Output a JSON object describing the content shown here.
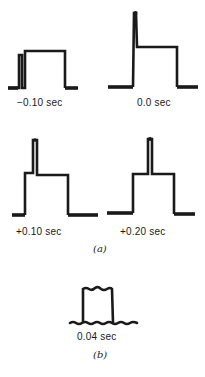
{
  "figure": {
    "panel_a": {
      "label": "(a)",
      "traces": [
        {
          "time_label": "−0.10 sec",
          "shape": "double-pulse"
        },
        {
          "time_label": "0.0 sec",
          "shape": "spike-then-plateau"
        },
        {
          "time_label": "+0.10 sec",
          "shape": "step-spike-plateau"
        },
        {
          "time_label": "+0.20 sec",
          "shape": "plateau-spike-plateau"
        }
      ]
    },
    "panel_b": {
      "label": "(b)",
      "traces": [
        {
          "time_label": "0.04 sec",
          "shape": "single-pulse"
        }
      ]
    }
  }
}
